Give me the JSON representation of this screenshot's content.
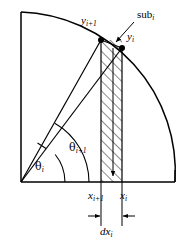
{
  "figure": {
    "type": "geometric-diagram",
    "background_color": "#ffffff",
    "stroke_color": "#000000"
  },
  "labels": {
    "y_next": {
      "base": "y",
      "sub": "i+1",
      "text": "y",
      "sub_text": "i+1"
    },
    "y_current": {
      "base": "y",
      "sub": "i",
      "text": "y",
      "sub_text": "i"
    },
    "sub_region": {
      "base": "sub",
      "sub": "i",
      "text": "sub",
      "sub_text": "i"
    },
    "theta_next": {
      "base": "θ",
      "sub": "i+1",
      "text": "θ",
      "sub_text": "i+1"
    },
    "theta_current": {
      "base": "θ",
      "sub": "i",
      "text": "θ",
      "sub_text": "i"
    },
    "x_next": {
      "base": "x",
      "sub": "i+1",
      "text": "x",
      "sub_text": "i+1"
    },
    "x_current": {
      "base": "x",
      "sub": "i",
      "text": "x",
      "sub_text": "i"
    },
    "dx": {
      "base": "dx",
      "sub": "i",
      "text": "dx",
      "sub_text": "i"
    }
  },
  "geometry": {
    "origin": {
      "x": 21,
      "y": 182
    },
    "arc_start": {
      "x": 21,
      "y": 12
    },
    "arc_end": {
      "x": 175,
      "y": 182
    },
    "radius": 160,
    "point_y_next": {
      "x": 101,
      "y": 40
    },
    "point_y_current": {
      "x": 122,
      "y": 48
    },
    "strip_left_x": 101,
    "strip_right_x": 122,
    "baseline_y": 182,
    "left_edge_x": 21,
    "right_edge_x": 175,
    "top_edge_y": 12,
    "angle_arc_inner_radius": 44,
    "angle_arc_outer_radius": 68,
    "dimension_line_y": 216
  },
  "colors": {
    "stroke": "#000000",
    "hatch": "#000000",
    "fill": "#ffffff",
    "point": "#000000"
  }
}
